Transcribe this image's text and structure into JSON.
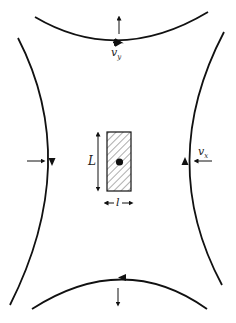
{
  "diagram": {
    "colors": {
      "stroke": "#111111",
      "background": "#ffffff"
    },
    "labels": {
      "vy": {
        "main": "v",
        "sub": "y"
      },
      "vx": {
        "main": "v",
        "sub": "x"
      },
      "length": "L",
      "width": "l"
    },
    "streamlines": [
      {
        "id": "top",
        "direction": "right"
      },
      {
        "id": "bottom",
        "direction": "left"
      },
      {
        "id": "left",
        "direction": "down"
      },
      {
        "id": "right",
        "direction": "up"
      }
    ],
    "velocity_arrows": [
      {
        "id": "top",
        "direction": "up"
      },
      {
        "id": "bottom",
        "direction": "down"
      },
      {
        "id": "left",
        "direction": "right"
      },
      {
        "id": "right",
        "direction": "left"
      }
    ],
    "particle": {
      "shape": "hatched rectangle",
      "center_dot": true
    }
  }
}
